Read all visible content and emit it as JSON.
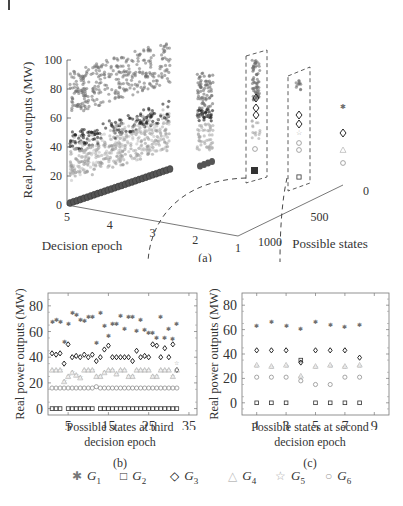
{
  "figure": {
    "panel_a": {
      "label": "(a)",
      "ylabel": "Real power outputs (MW)",
      "xlabel": "Decision epoch",
      "zlabel": "Possible states",
      "yticks": [
        "0",
        "20",
        "40",
        "60",
        "80",
        "100"
      ],
      "xticks": [
        "5",
        "4",
        "3",
        "2",
        "1"
      ],
      "zticks": [
        "1000",
        "500",
        "0"
      ]
    },
    "panel_b": {
      "label": "(b)",
      "ylabel": "Real power outputs (MW)",
      "xlabel_line1": "Possible states at third",
      "xlabel_line2": "decision epoch",
      "yticks": [
        "0",
        "20",
        "40",
        "60",
        "80"
      ],
      "xticks": [
        "5",
        "15",
        "25",
        "35"
      ]
    },
    "panel_c": {
      "label": "(c)",
      "ylabel": "Real power outputs (MW)",
      "xlabel_line1": "Possible states at second",
      "xlabel_line2": "decision epoch",
      "yticks": [
        "0",
        "20",
        "40",
        "60",
        "80"
      ],
      "xticks": [
        "1",
        "3",
        "5",
        "7",
        "9"
      ]
    },
    "legend": [
      {
        "symbol": "hourglass-star",
        "glyph": "✱",
        "name": "G",
        "sub": "1",
        "color": "#777777"
      },
      {
        "symbol": "square",
        "glyph": "□",
        "name": "G",
        "sub": "2",
        "color": "#333333"
      },
      {
        "symbol": "diamond",
        "glyph": "◇",
        "name": "G",
        "sub": "3",
        "color": "#111111"
      },
      {
        "symbol": "triangle",
        "glyph": "△",
        "name": "G",
        "sub": "4",
        "color": "#bbbbbb"
      },
      {
        "symbol": "star",
        "glyph": "☆",
        "name": "G",
        "sub": "5",
        "color": "#aaaaaa"
      },
      {
        "symbol": "circle",
        "glyph": "○",
        "name": "G",
        "sub": "6",
        "color": "#999999"
      }
    ]
  },
  "chart_data": [
    {
      "type": "scatter",
      "title": "(a)",
      "xlabel": "Decision epoch",
      "ylabel": "Real power outputs (MW)",
      "zlabel": "Possible states",
      "xlim": [
        1,
        5
      ],
      "ylim": [
        0,
        100
      ],
      "zlim": [
        0,
        1000
      ],
      "note": "3D scatter of generator outputs vs decision epoch and possible states; G1 ~60-100, G3 ~35-80, G4/G5/G6 ~15-60, G2 ~0-35 rising with epoch",
      "series": [
        {
          "name": "G1",
          "range": [
            60,
            100
          ]
        },
        {
          "name": "G2",
          "range": [
            0,
            35
          ]
        },
        {
          "name": "G3",
          "range": [
            35,
            80
          ]
        },
        {
          "name": "G4",
          "range": [
            15,
            55
          ]
        },
        {
          "name": "G5",
          "range": [
            15,
            55
          ]
        },
        {
          "name": "G6",
          "range": [
            15,
            50
          ]
        }
      ]
    },
    {
      "type": "scatter",
      "title": "(b)",
      "xlabel": "Possible states at third decision epoch",
      "ylabel": "Real power outputs (MW)",
      "xlim": [
        0,
        37
      ],
      "ylim": [
        -5,
        90
      ],
      "x": [
        1,
        2,
        3,
        4,
        5,
        6,
        7,
        8,
        9,
        10,
        11,
        12,
        13,
        14,
        15,
        16,
        17,
        18,
        19,
        20,
        21,
        22,
        23,
        24,
        25,
        26,
        27,
        28,
        29,
        30,
        31,
        32
      ],
      "series": [
        {
          "name": "G1",
          "values": [
            68,
            70,
            68,
            53,
            67,
            75,
            74,
            70,
            69,
            72,
            72,
            52,
            75,
            65,
            57,
            67,
            67,
            73,
            63,
            72,
            72,
            61,
            70,
            62,
            60,
            60,
            56,
            72,
            56,
            63,
            55,
            67
          ]
        },
        {
          "name": "G2",
          "values": [
            0,
            0,
            0,
            null,
            0,
            0,
            0,
            0,
            0,
            0,
            0,
            null,
            0,
            0,
            0,
            0,
            0,
            0,
            0,
            0,
            0,
            0,
            0,
            0,
            0,
            0,
            0,
            0,
            0,
            0,
            0,
            0
          ]
        },
        {
          "name": "G3",
          "values": [
            43,
            42,
            43,
            35,
            50,
            40,
            41,
            40,
            42,
            40,
            42,
            37,
            40,
            46,
            49,
            40,
            40,
            40,
            40,
            40,
            37,
            45,
            40,
            41,
            40,
            50,
            49,
            40,
            47,
            40,
            50,
            30
          ]
        },
        {
          "name": "G4",
          "values": [
            30,
            30,
            30,
            21,
            25,
            28,
            26,
            24,
            30,
            30,
            30,
            25,
            25,
            28,
            30,
            30,
            27,
            30,
            30,
            25,
            25,
            30,
            30,
            30,
            30,
            25,
            25,
            30,
            30,
            30,
            25,
            30
          ]
        },
        {
          "name": "G5",
          "values": [
            31,
            31,
            31,
            22,
            26,
            29,
            27,
            25,
            31,
            31,
            31,
            26,
            26,
            29,
            31,
            31,
            28,
            31,
            31,
            26,
            26,
            31,
            31,
            31,
            31,
            26,
            26,
            31,
            31,
            31,
            26,
            36
          ]
        },
        {
          "name": "G6",
          "values": [
            16,
            16,
            16,
            16,
            16,
            16,
            16,
            16,
            16,
            16,
            16,
            17,
            16,
            16,
            16,
            16,
            16,
            16,
            16,
            16,
            16,
            16,
            16,
            16,
            16,
            16,
            16,
            16,
            16,
            16,
            16,
            16
          ]
        }
      ]
    },
    {
      "type": "scatter",
      "title": "(c)",
      "xlabel": "Possible states at second decision epoch",
      "ylabel": "Real power outputs (MW)",
      "xlim": [
        0,
        10
      ],
      "ylim": [
        -10,
        90
      ],
      "x": [
        1,
        2,
        3,
        4,
        5,
        6,
        7,
        8
      ],
      "series": [
        {
          "name": "G1",
          "values": [
            64,
            67,
            64,
            61,
            67,
            65,
            63,
            65
          ]
        },
        {
          "name": "G2",
          "values": [
            0,
            0,
            0,
            35,
            0,
            0,
            0,
            0
          ]
        },
        {
          "name": "G3",
          "values": [
            43,
            43,
            43,
            33,
            43,
            43,
            43,
            37
          ]
        },
        {
          "name": "G4",
          "values": [
            31,
            30,
            31,
            22,
            30,
            31,
            30,
            31
          ]
        },
        {
          "name": "G5",
          "values": [
            31,
            30,
            31,
            22,
            30,
            31,
            30,
            31
          ]
        },
        {
          "name": "G6",
          "values": [
            21,
            21,
            21,
            18,
            15,
            15,
            21,
            21
          ]
        }
      ]
    }
  ]
}
